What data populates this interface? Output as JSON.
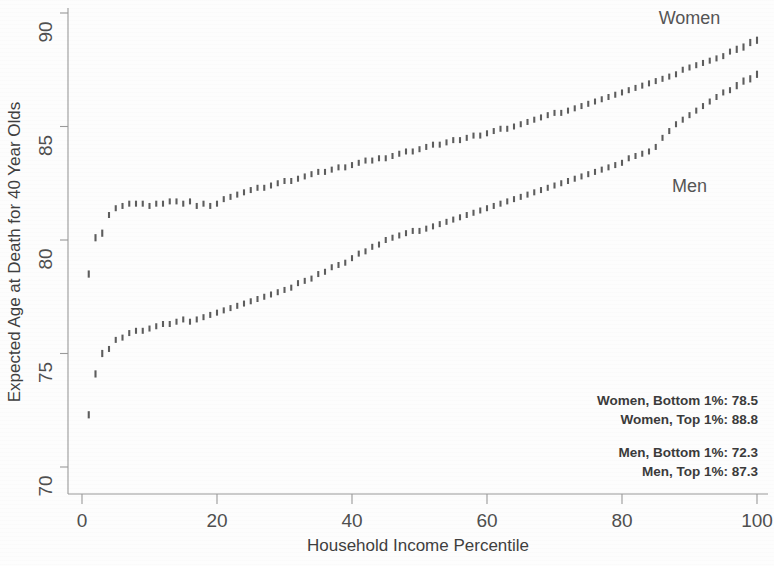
{
  "chart_data": {
    "type": "scatter",
    "title": "",
    "xlabel": "Household Income Percentile",
    "ylabel": "Expected Age at Death for 40 Year Olds",
    "xlim": [
      0,
      101
    ],
    "ylim": [
      69.4,
      90.2
    ],
    "xticks": [
      0,
      20,
      40,
      60,
      80,
      100
    ],
    "xtick_labels": [
      "0",
      "20",
      "40",
      "60",
      "80",
      "100"
    ],
    "yticks": [
      70,
      75,
      80,
      85,
      90
    ],
    "ytick_labels": [
      "70",
      "75",
      "80",
      "85",
      "90"
    ],
    "grid": false,
    "legend_position": "inline-annotations",
    "marker": "vertical-dash",
    "series": [
      {
        "name": "Women",
        "label": "Women",
        "label_x": 90,
        "label_y": 89.5,
        "color": "#5d5d5d",
        "x": [
          1,
          2,
          3,
          4,
          5,
          6,
          7,
          8,
          9,
          10,
          11,
          12,
          13,
          14,
          15,
          16,
          17,
          18,
          19,
          20,
          21,
          22,
          23,
          24,
          25,
          26,
          27,
          28,
          29,
          30,
          31,
          32,
          33,
          34,
          35,
          36,
          37,
          38,
          39,
          40,
          41,
          42,
          43,
          44,
          45,
          46,
          47,
          48,
          49,
          50,
          51,
          52,
          53,
          54,
          55,
          56,
          57,
          58,
          59,
          60,
          61,
          62,
          63,
          64,
          65,
          66,
          67,
          68,
          69,
          70,
          71,
          72,
          73,
          74,
          75,
          76,
          77,
          78,
          79,
          80,
          81,
          82,
          83,
          84,
          85,
          86,
          87,
          88,
          89,
          90,
          91,
          92,
          93,
          94,
          95,
          96,
          97,
          98,
          99,
          100
        ],
        "values": [
          78.5,
          80.1,
          80.3,
          81.1,
          81.4,
          81.5,
          81.6,
          81.6,
          81.6,
          81.5,
          81.6,
          81.6,
          81.7,
          81.7,
          81.6,
          81.7,
          81.5,
          81.6,
          81.5,
          81.6,
          81.8,
          81.9,
          82.0,
          82.1,
          82.2,
          82.3,
          82.3,
          82.4,
          82.5,
          82.6,
          82.6,
          82.7,
          82.8,
          82.9,
          83.0,
          83.0,
          83.1,
          83.2,
          83.2,
          83.3,
          83.4,
          83.5,
          83.5,
          83.6,
          83.6,
          83.7,
          83.8,
          83.9,
          83.9,
          84.0,
          84.1,
          84.2,
          84.2,
          84.3,
          84.4,
          84.4,
          84.5,
          84.6,
          84.6,
          84.7,
          84.8,
          84.9,
          84.9,
          85.0,
          85.1,
          85.2,
          85.3,
          85.4,
          85.5,
          85.6,
          85.6,
          85.7,
          85.8,
          85.9,
          86.0,
          86.1,
          86.2,
          86.3,
          86.4,
          86.5,
          86.6,
          86.7,
          86.8,
          86.9,
          87.0,
          87.1,
          87.2,
          87.3,
          87.5,
          87.6,
          87.7,
          87.8,
          87.9,
          88.0,
          88.1,
          88.3,
          88.4,
          88.5,
          88.7,
          88.8
        ]
      },
      {
        "name": "Men",
        "label": "Men",
        "label_x": 90,
        "label_y": 82.1,
        "color": "#5d5d5d",
        "x": [
          1,
          2,
          3,
          4,
          5,
          6,
          7,
          8,
          9,
          10,
          11,
          12,
          13,
          14,
          15,
          16,
          17,
          18,
          19,
          20,
          21,
          22,
          23,
          24,
          25,
          26,
          27,
          28,
          29,
          30,
          31,
          32,
          33,
          34,
          35,
          36,
          37,
          38,
          39,
          40,
          41,
          42,
          43,
          44,
          45,
          46,
          47,
          48,
          49,
          50,
          51,
          52,
          53,
          54,
          55,
          56,
          57,
          58,
          59,
          60,
          61,
          62,
          63,
          64,
          65,
          66,
          67,
          68,
          69,
          70,
          71,
          72,
          73,
          74,
          75,
          76,
          77,
          78,
          79,
          80,
          81,
          82,
          83,
          84,
          85,
          86,
          87,
          88,
          89,
          90,
          91,
          92,
          93,
          94,
          95,
          96,
          97,
          98,
          99,
          100
        ],
        "values": [
          72.3,
          74.1,
          75.0,
          75.2,
          75.6,
          75.7,
          75.9,
          76.0,
          76.0,
          76.1,
          76.2,
          76.3,
          76.3,
          76.4,
          76.5,
          76.4,
          76.5,
          76.6,
          76.7,
          76.8,
          76.9,
          77.0,
          77.1,
          77.2,
          77.3,
          77.4,
          77.5,
          77.6,
          77.7,
          77.8,
          77.9,
          78.1,
          78.2,
          78.3,
          78.5,
          78.6,
          78.8,
          78.9,
          79.0,
          79.2,
          79.4,
          79.5,
          79.7,
          79.8,
          80.0,
          80.1,
          80.2,
          80.3,
          80.4,
          80.4,
          80.5,
          80.6,
          80.7,
          80.8,
          80.9,
          81.0,
          81.1,
          81.2,
          81.3,
          81.4,
          81.5,
          81.6,
          81.7,
          81.8,
          81.9,
          82.0,
          82.1,
          82.2,
          82.3,
          82.4,
          82.5,
          82.6,
          82.7,
          82.8,
          82.9,
          83.0,
          83.1,
          83.2,
          83.3,
          83.4,
          83.6,
          83.7,
          83.8,
          83.9,
          84.1,
          84.5,
          84.8,
          85.1,
          85.3,
          85.5,
          85.7,
          85.9,
          86.1,
          86.3,
          86.5,
          86.6,
          86.8,
          87.0,
          87.1,
          87.3
        ]
      }
    ],
    "annotations": [
      {
        "text": "Women, Bottom 1%: 78.5"
      },
      {
        "text": "Women, Top 1%: 88.8"
      },
      {
        "text": "Men, Bottom 1%: 72.3"
      },
      {
        "text": "Men, Top 1%: 87.3"
      }
    ],
    "colors": {
      "marker": "#5d5d5d",
      "axis": "#9a9a9a",
      "text": "#3f3f3f",
      "background": "#fdfdfd"
    }
  }
}
